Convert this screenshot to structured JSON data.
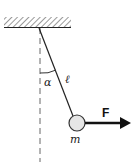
{
  "diagram": {
    "title": "",
    "type": "pendulum-force",
    "labels": {
      "angle": "α",
      "length": "ℓ",
      "mass": "m",
      "force": "F"
    },
    "colors": {
      "line": "#222222",
      "ball_fill": "#e6e6e6",
      "dashed": "#555555"
    },
    "geometry": {
      "pivot": [
        39,
        28
      ],
      "ball_center": [
        77,
        123
      ],
      "ball_radius": 8,
      "arrow_end": [
        130,
        123
      ]
    }
  }
}
